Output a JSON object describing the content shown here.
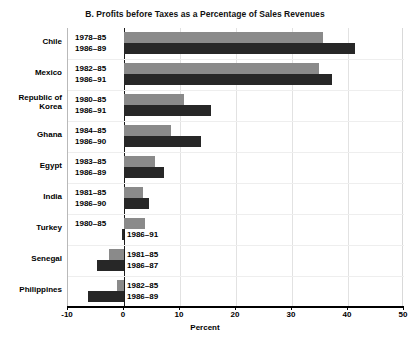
{
  "chart_data": {
    "type": "bar",
    "orientation": "horizontal",
    "title": "B. Profits before Taxes as a Percentage of Sales Revenues",
    "xlabel": "Percent",
    "ylabel": "",
    "xlim": [
      -10,
      50
    ],
    "xticks": [
      -10,
      0,
      10,
      20,
      30,
      40,
      50
    ],
    "xticklabels": [
      "-10",
      "0",
      "10",
      "20",
      "30",
      "40",
      "50"
    ],
    "grid": true,
    "legend": "none",
    "categories": [
      "Chile",
      "Mexico",
      "Republic of\nKorea",
      "Ghana",
      "Egypt",
      "India",
      "Turkey",
      "Senegal",
      "Philippines"
    ],
    "groups": [
      {
        "country": "Chile",
        "country_line1": "Chile",
        "country_line2": "",
        "bars": [
          {
            "period": "1978–85",
            "value": 35.6,
            "color": "#8a8a8a",
            "label_side": "left"
          },
          {
            "period": "1986–89",
            "value": 41.3,
            "color": "#272727",
            "label_side": "left"
          }
        ]
      },
      {
        "country": "Mexico",
        "country_line1": "Mexico",
        "country_line2": "",
        "bars": [
          {
            "period": "1982–85",
            "value": 34.9,
            "color": "#8a8a8a",
            "label_side": "left"
          },
          {
            "period": "1986–91",
            "value": 37.1,
            "color": "#272727",
            "label_side": "left"
          }
        ]
      },
      {
        "country": "Republic of Korea",
        "country_line1": "Republic of",
        "country_line2": "Korea",
        "bars": [
          {
            "period": "1980–85",
            "value": 10.7,
            "color": "#8a8a8a",
            "label_side": "left"
          },
          {
            "period": "1986–91",
            "value": 15.6,
            "color": "#272727",
            "label_side": "left"
          }
        ]
      },
      {
        "country": "Ghana",
        "country_line1": "Ghana",
        "country_line2": "",
        "bars": [
          {
            "period": "1984–85",
            "value": 8.3,
            "color": "#8a8a8a",
            "label_side": "left"
          },
          {
            "period": "1986–90",
            "value": 13.7,
            "color": "#272727",
            "label_side": "left"
          }
        ]
      },
      {
        "country": "Egypt",
        "country_line1": "Egypt",
        "country_line2": "",
        "bars": [
          {
            "period": "1983–85",
            "value": 5.5,
            "color": "#8a8a8a",
            "label_side": "left"
          },
          {
            "period": "1986–89",
            "value": 7.2,
            "color": "#272727",
            "label_side": "left"
          }
        ]
      },
      {
        "country": "India",
        "country_line1": "India",
        "country_line2": "",
        "bars": [
          {
            "period": "1981–85",
            "value": 3.4,
            "color": "#8a8a8a",
            "label_side": "left"
          },
          {
            "period": "1986–90",
            "value": 4.5,
            "color": "#272727",
            "label_side": "left"
          }
        ]
      },
      {
        "country": "Turkey",
        "country_line1": "Turkey",
        "country_line2": "",
        "bars": [
          {
            "period": "1980–85",
            "value": 3.7,
            "color": "#8a8a8a",
            "label_side": "left"
          },
          {
            "period": "1986–91",
            "value": -0.3,
            "color": "#272727",
            "label_side": "right"
          }
        ]
      },
      {
        "country": "Senegal",
        "country_line1": "Senegal",
        "country_line2": "",
        "bars": [
          {
            "period": "1981–85",
            "value": -2.7,
            "color": "#8a8a8a",
            "label_side": "right"
          },
          {
            "period": "1986–87",
            "value": -4.8,
            "color": "#272727",
            "label_side": "right"
          }
        ]
      },
      {
        "country": "Philippines",
        "country_line1": "Philippines",
        "country_line2": "",
        "bars": [
          {
            "period": "1982–85",
            "value": -1.3,
            "color": "#8a8a8a",
            "label_side": "right"
          },
          {
            "period": "1986–89",
            "value": -6.5,
            "color": "#272727",
            "label_side": "right"
          }
        ]
      }
    ],
    "series": [
      {
        "name": "Earlier period",
        "color": "#8a8a8a",
        "values": [
          35.6,
          34.9,
          10.7,
          8.3,
          5.5,
          3.4,
          3.7,
          -2.7,
          -1.3
        ]
      },
      {
        "name": "Later period",
        "color": "#272727",
        "values": [
          41.3,
          37.1,
          15.6,
          13.7,
          7.2,
          4.5,
          -0.3,
          -4.8,
          -6.5
        ]
      }
    ]
  },
  "layout": {
    "plot_left_px": 67,
    "plot_top_px": 28,
    "plot_width_px": 336,
    "plot_height_px": 279,
    "px_per_unit": 5.586,
    "zero_x_px": 122.6
  }
}
